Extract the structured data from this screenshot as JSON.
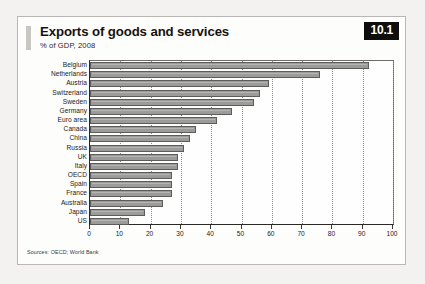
{
  "figure": {
    "badge": "10.1",
    "title": "Exports of goods and services",
    "subtitle": "% of GDP, 2008",
    "source_note": "Sources: OECD; World Bank"
  },
  "chart_data": {
    "type": "bar",
    "orientation": "horizontal",
    "title": "Exports of goods and services",
    "subtitle": "% of GDP, 2008",
    "xlabel": "",
    "ylabel": "",
    "xlim": [
      0,
      100
    ],
    "xticks": [
      0,
      10,
      20,
      30,
      40,
      50,
      60,
      70,
      80,
      90,
      100
    ],
    "grid": "vertical-dotted",
    "legend": "none",
    "bar_color": "#9b9b99",
    "bar_border_color": "#5d5c5a",
    "categories": [
      "Belgium",
      "Netherlands",
      "Austria",
      "Switzerland",
      "Sweden",
      "Germany",
      "Euro area",
      "Canada",
      "China",
      "Russia",
      "UK",
      "Italy",
      "OECD",
      "Spain",
      "France",
      "Australia",
      "Japan",
      "US"
    ],
    "values": [
      92,
      76,
      59,
      56,
      54,
      47,
      42,
      35,
      33,
      31,
      29,
      29,
      27,
      27,
      27,
      24,
      18,
      13
    ]
  }
}
